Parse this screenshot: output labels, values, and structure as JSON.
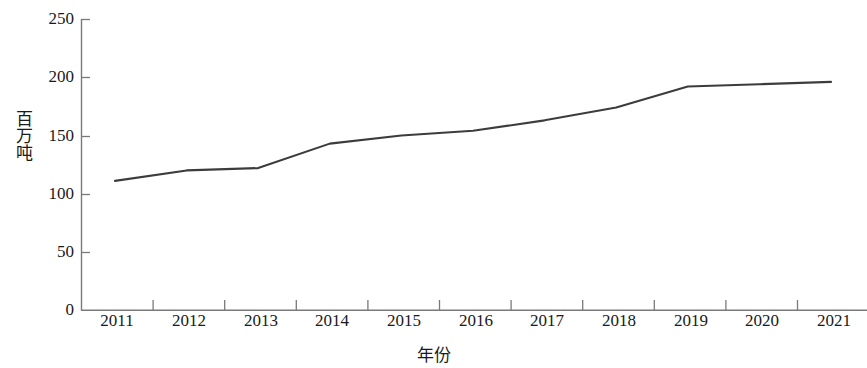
{
  "chart_data": {
    "type": "line",
    "title": "",
    "xlabel": "年份",
    "ylabel": "百万吨",
    "categories": [
      "2011",
      "2012",
      "2013",
      "2014",
      "2015",
      "2016",
      "2017",
      "2018",
      "2019",
      "2020",
      "2021"
    ],
    "x": [
      2011,
      2012,
      2013,
      2014,
      2015,
      2016,
      2017,
      2018,
      2019,
      2020,
      2021
    ],
    "values": [
      111,
      120,
      122,
      143,
      150,
      154,
      163,
      174,
      192,
      194,
      196
    ],
    "series": [
      {
        "name": "",
        "values": [
          111,
          120,
          122,
          143,
          150,
          154,
          163,
          174,
          192,
          194,
          196
        ]
      }
    ],
    "ylim": [
      0,
      250
    ],
    "yticks": [
      0,
      50,
      100,
      150,
      200,
      250
    ],
    "ytick_labels": [
      "0",
      "50",
      "100",
      "150",
      "200",
      "250"
    ],
    "xtick_labels": [
      "2011",
      "2012",
      "2013",
      "2014",
      "2015",
      "2016",
      "2017",
      "2018",
      "2019",
      "2020",
      "2021"
    ],
    "grid": false,
    "legend": false,
    "legend_position": "none",
    "line_color": "#3c3c3c",
    "axis_color": "#7a7a7a"
  },
  "axes": {
    "y_title": "百万吨",
    "x_title": "年份",
    "y_labels": [
      "250",
      "200",
      "150",
      "100",
      "50",
      "0"
    ],
    "x_labels": [
      "2011",
      "2012",
      "2013",
      "2014",
      "2015",
      "2016",
      "2017",
      "2018",
      "2019",
      "2020",
      "2021"
    ]
  }
}
